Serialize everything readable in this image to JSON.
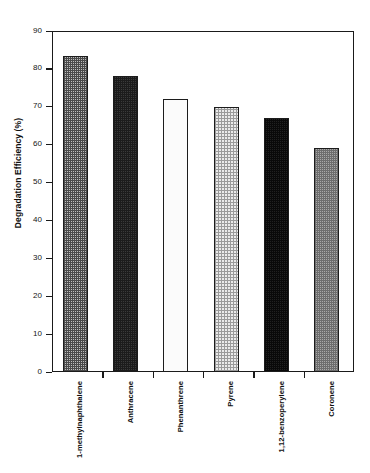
{
  "chart_data": {
    "type": "bar",
    "title": "",
    "subtitle": "",
    "xlabel": "",
    "ylabel": "Degradation Efficiency (%)",
    "categories": [
      "1-methylnaphthalene",
      "Anthracene",
      "Phenanthrene",
      "Pyrene",
      "1,12-benzoperylene",
      "Coronene"
    ],
    "values": [
      83.5,
      78.0,
      72.0,
      70.0,
      67.0,
      59.0
    ],
    "ylim": [
      0,
      90
    ],
    "yticks": [
      0,
      10,
      20,
      30,
      40,
      50,
      60,
      70,
      80,
      90
    ],
    "ytick_labels": [
      "0",
      "10",
      "20",
      "30",
      "40",
      "50",
      "60",
      "70",
      "80",
      "90"
    ],
    "grid": false,
    "legend": null,
    "bar_fills": [
      "medium-checker-gray",
      "dark-checker-gray",
      "white-solid",
      "light-checker-gray",
      "very-dark-checker",
      "medium-gray-checker"
    ],
    "bar_edge_color": "#1c1c1c",
    "axis_color": "#1a1a1a",
    "background_color": "#ffffff"
  }
}
